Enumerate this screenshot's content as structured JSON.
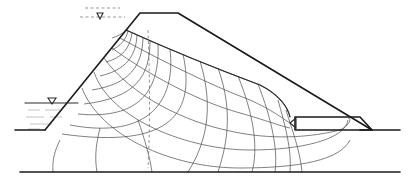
{
  "diagram": {
    "title": "",
    "type": "seepage flow net through earth dam with toe drain",
    "colors": {
      "line": "#1a1a1a",
      "grid": "#4a4a4a",
      "dashed": "#6a6a6a",
      "water": "#9a9a9a",
      "background": "#ffffff"
    },
    "elements": {
      "dam_outline": "M45,130 L140,13 L178,13 L372,130",
      "upstream_ground": "M15,130 L45,130",
      "downstream_ground": "M360,130 L400,130",
      "impervious_base": "M20,172 L400,172",
      "reservoir_surface": "M25,103 L78,103",
      "reservoir_triangle": "M48,98 L56,98 L52,104 Z",
      "phreatic_top_dashed_1": "M85,8 L120,8",
      "phreatic_top_dashed_2": "M80,17 L125,17",
      "phreatic_triangle": "M97,13 L103,13 L100,19 Z",
      "toe_drain_rect": "M295,117 L360,117 L372,130 L295,130 Z",
      "toe_drain_tip": "M290,123 L296,118 L296,128 Z",
      "phreatic_surface": "M126,30 C170,50 220,70 260,85 C280,95 288,108 290,117",
      "dashed_center_line": "M148,30 C150,80 150,130 148,168"
    },
    "flow_lines": [
      "M126,30 C170,50 220,70 260,85 C280,95 288,108 290,117",
      "M120,38 C160,60 210,85 250,100 C272,110 282,118 290,123",
      "M112,48 C150,76 200,102 240,113 C265,120 280,126 290,128",
      "M104,58 C130,95 185,122 230,131 C260,138 300,140 340,130 C350,125 352,118 348,118",
      "M94,72 C110,120 190,150 250,150 C300,150 345,140 348,120",
      "M82,88 C100,135 170,168 240,168 C300,168 340,160 350,140"
    ],
    "equipotential_lines": [
      "M126,30 C122,34 118,36 112,38",
      "M128,31 C126,40 120,46 112,50",
      "M132,33 C130,48 122,58 106,62",
      "M137,35 C136,56 126,70 100,76",
      "M143,38 C142,66 130,84 92,90",
      "M150,41 C150,76 136,98 84,104",
      "M158,44 C160,90 140,120 78,114",
      "M170,49 C176,100 150,140 70,125",
      "M183,54 C195,110 175,150 62,134",
      "M200,61 C215,110 205,145 188,172",
      "M218,68 C235,115 225,150 218,172",
      "M238,76 C255,118 258,150 252,172",
      "M258,84 C272,120 278,150 275,172",
      "M278,100 C285,125 292,150 290,172",
      "M286,110 C292,130 300,150 302,172"
    ],
    "vertical_flow_lines": [
      "M60,140 C55,150 52,160 53,172",
      "M100,128 C95,148 95,160 97,172",
      "M138,120 C145,140 150,158 152,172"
    ]
  }
}
